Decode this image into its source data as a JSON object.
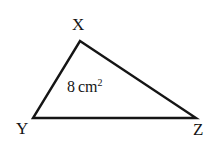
{
  "figure": {
    "type": "triangle-diagram",
    "background_color": "#ffffff",
    "stroke_color": "#151515",
    "stroke_width": 2.4,
    "vertices": [
      {
        "name": "X",
        "label": "X",
        "x": 80,
        "y": 41,
        "label_x": 72,
        "label_y": 16
      },
      {
        "name": "Y",
        "label": "Y",
        "x": 33,
        "y": 118,
        "label_x": 16,
        "label_y": 120
      },
      {
        "name": "Z",
        "label": "Z",
        "x": 196,
        "y": 118,
        "label_x": 193,
        "label_y": 121
      }
    ],
    "edges": [
      {
        "name": "edge-XY",
        "from": "X",
        "to": "Y"
      },
      {
        "name": "edge-XZ",
        "from": "X",
        "to": "Z"
      },
      {
        "name": "edge-YZ",
        "from": "Y",
        "to": "Z"
      }
    ],
    "area_label": {
      "value": "8",
      "unit": "cm",
      "exponent": "2",
      "full_text": "8 cm²"
    }
  }
}
